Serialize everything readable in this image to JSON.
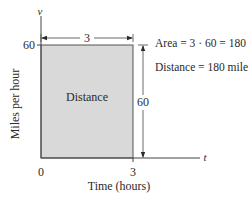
{
  "diagram": {
    "axes": {
      "y_label": "v",
      "x_label": "t",
      "y_title": "Miles per hour",
      "x_title": "Time (hours)",
      "x_ticks": [
        "0",
        "3"
      ],
      "y_ticks": [
        "60"
      ]
    },
    "region": {
      "label": "Distance",
      "fill_color": "#d9d9d9",
      "t_from": 0,
      "t_to": 3,
      "v_value": 60
    },
    "dimensions": {
      "width_label": "3",
      "height_label": "60"
    },
    "annotations": {
      "area": "Area = 3 · 60 = 180",
      "distance": "Distance = 180 miles"
    }
  }
}
